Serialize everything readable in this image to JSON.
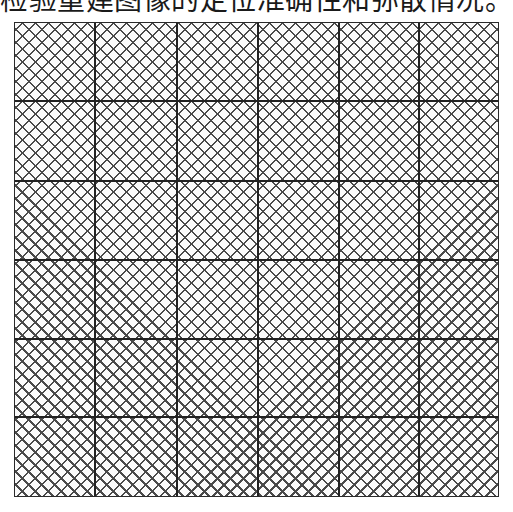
{
  "caption": "检验重建图像的定位准确性和弥散情况。",
  "figure": {
    "type": "square-grid-with-diamond-mesh",
    "rows": 6,
    "columns": 6,
    "line_color": "#222222",
    "mesh_color": "#4a4a4a",
    "background": "#ffffff",
    "vertical_lines_x": [
      94,
      176,
      257,
      338,
      418
    ],
    "horizontal_lines_y": [
      100,
      180,
      259,
      338,
      416
    ]
  }
}
